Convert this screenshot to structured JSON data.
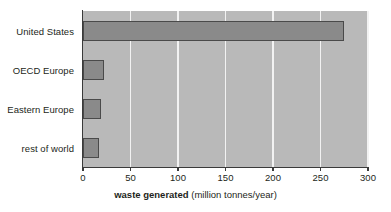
{
  "chart_data": {
    "type": "bar",
    "orientation": "horizontal",
    "title": "",
    "categories": [
      "United States",
      "OECD Europe",
      "Eastern Europe",
      "rest of world"
    ],
    "values": [
      275,
      22,
      19,
      17
    ],
    "xlabel_bold": "waste generated",
    "xlabel_units": "(million tonnes/year)",
    "ylabel": "",
    "xlim": [
      0,
      300
    ],
    "xticks": [
      0,
      50,
      100,
      150,
      200,
      250,
      300
    ],
    "xtick_labels": [
      "0",
      "50",
      "100",
      "150",
      "200",
      "250",
      "300"
    ],
    "grid": true,
    "grid_axis": "x",
    "legend": false,
    "colors": {
      "plot_background": "#b9b9b9",
      "bar_fill": "#8a8a8a",
      "bar_border": "#4a4a4a",
      "gridline": "#f2f2f2",
      "axis_line": "#3a3a3a",
      "text": "#231f20",
      "page_background": "#ffffff"
    }
  }
}
